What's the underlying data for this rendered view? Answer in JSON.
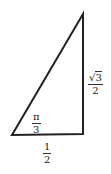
{
  "diagram": {
    "type": "right-triangle",
    "stroke_color": "#222222",
    "vertices": {
      "top": [
        83,
        14
      ],
      "bottom_left": [
        12,
        135
      ],
      "bottom_right": [
        83,
        134
      ]
    },
    "right_angle_at": "bottom_right",
    "labels": {
      "angle": {
        "num": "π",
        "den": "3",
        "position": "inside bottom-left angle"
      },
      "vertical_side": {
        "radical": "√",
        "radicand": "3",
        "den": "2",
        "position": "right of vertical side"
      },
      "base": {
        "num": "1",
        "den": "2",
        "position": "below base"
      }
    }
  }
}
